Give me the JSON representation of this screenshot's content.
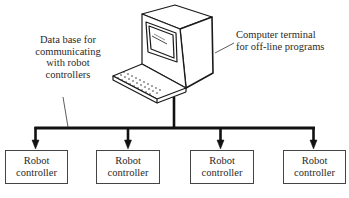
{
  "diagram": {
    "type": "network-topology",
    "central_node": {
      "icon": "computer-terminal-icon",
      "label_line1": "Computer terminal",
      "label_line2": "for off-line programs"
    },
    "bus": {
      "label_lines": [
        "Data base for",
        "communicating",
        "with robot",
        "controllers"
      ]
    },
    "controllers": [
      {
        "line1": "Robot",
        "line2": "controller"
      },
      {
        "line1": "Robot",
        "line2": "controller"
      },
      {
        "line1": "Robot",
        "line2": "controller"
      },
      {
        "line1": "Robot",
        "line2": "controller"
      }
    ],
    "colors": {
      "line": "#111111",
      "box_border": "#444444",
      "text": "#2a2a2a"
    }
  }
}
